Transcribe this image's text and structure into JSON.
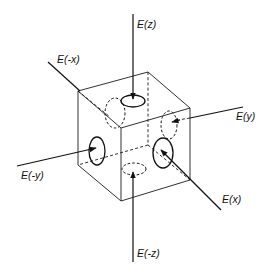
{
  "diagram": {
    "type": "cube-electric-field-flux",
    "labels": {
      "e_z": "E(z)",
      "e_neg_x": "E(-x)",
      "e_y": "E(y)",
      "e_neg_y": "E(-y)",
      "e_x": "E(x)",
      "e_neg_z": "E(-z)"
    },
    "colors": {
      "line": "#111111",
      "background": "#ffffff"
    }
  }
}
